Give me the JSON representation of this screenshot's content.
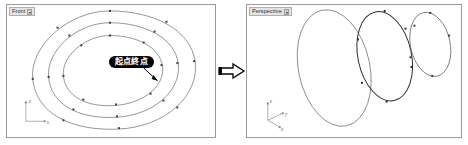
{
  "app": {
    "background_color": "#ffffff",
    "panel_border_color": "#9a9a9a",
    "curve_color": "#555555",
    "curve_highlight_color": "#1a1a1a",
    "control_point_color": "#3c3c3c",
    "callout_background": "#000000",
    "callout_text_color": "#ffffff"
  },
  "viewports": [
    {
      "id": "front",
      "label": "Front",
      "caret": "chevron-down-icon",
      "axes": {
        "vertical_label": "z",
        "horizontal_label": "x"
      },
      "curves": [
        {
          "name": "outer-closed-curve",
          "control_points": 8
        },
        {
          "name": "middle-closed-curve",
          "control_points": 8
        },
        {
          "name": "inner-closed-curve",
          "control_points": 8
        }
      ]
    },
    {
      "id": "perspective",
      "label": "Perspective",
      "caret": "chevron-down-icon",
      "axes": {
        "vertical_label": "z",
        "depth_label": "y",
        "horizontal_label": "x"
      },
      "curves": [
        {
          "name": "large-ellipse",
          "control_points": 0
        },
        {
          "name": "medium-ellipse",
          "control_points": 6
        },
        {
          "name": "small-ellipse",
          "control_points": 5
        }
      ]
    }
  ],
  "callouts": [
    {
      "id": "start-end-point",
      "text": "起点終点",
      "points_to": "inner-curve-right-side"
    }
  ],
  "transition": {
    "icon": "right-arrow-icon",
    "direction": "left-to-right"
  }
}
